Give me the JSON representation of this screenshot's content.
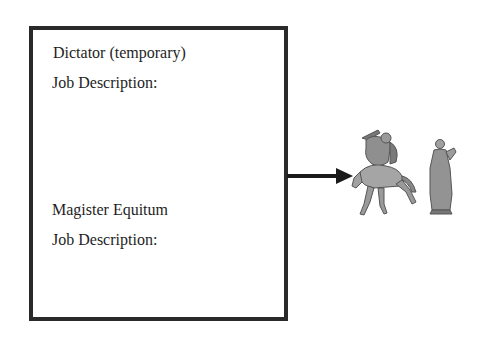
{
  "roles": [
    {
      "title": "Dictator (temporary)",
      "label": "Job Description:"
    },
    {
      "title": "Magister Equitum",
      "label": "Job Description:"
    }
  ],
  "figures": {
    "horseman": "mounted-warrior-illustration",
    "statue": "toga-figure-illustration"
  }
}
